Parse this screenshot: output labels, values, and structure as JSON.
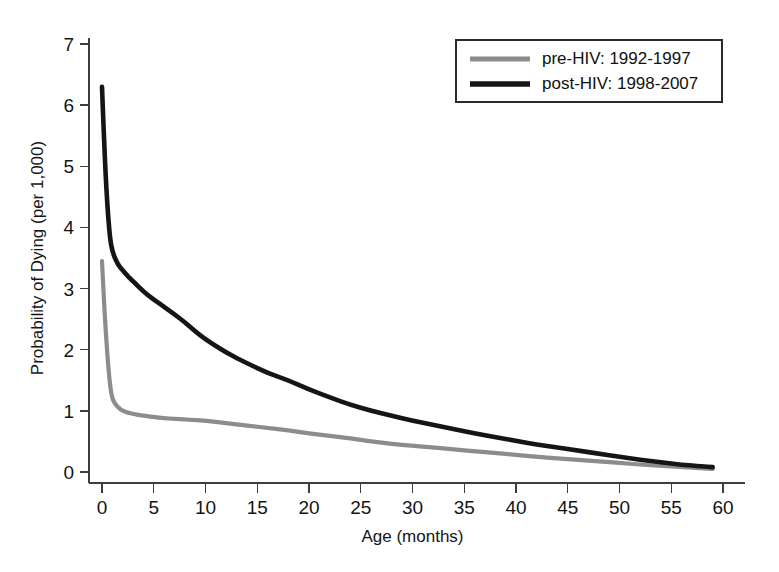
{
  "chart_data": {
    "type": "line",
    "title": "",
    "xlabel": "Age (months)",
    "ylabel": "Probability of Dying (per 1,000)",
    "xlim": [
      0,
      60
    ],
    "ylim": [
      0,
      7
    ],
    "xticks": [
      0,
      5,
      10,
      15,
      20,
      25,
      30,
      35,
      40,
      45,
      50,
      55,
      60
    ],
    "yticks": [
      0,
      1,
      2,
      3,
      4,
      5,
      6,
      7
    ],
    "xtick_labels": [
      "0",
      "5",
      "10",
      "15",
      "20",
      "25",
      "30",
      "35",
      "40",
      "45",
      "50",
      "55",
      "60"
    ],
    "ytick_labels": [
      "0",
      "1",
      "2",
      "3",
      "4",
      "5",
      "6",
      "7"
    ],
    "grid": false,
    "legend_position": "top-right",
    "x": [
      0,
      0.25,
      0.5,
      0.75,
      1,
      1.5,
      2,
      2.5,
      3,
      4,
      5,
      6,
      7,
      8,
      9,
      10,
      12,
      14,
      16,
      18,
      20,
      22,
      24,
      26,
      28,
      30,
      32,
      34,
      36,
      38,
      40,
      42,
      44,
      46,
      48,
      50,
      52,
      54,
      56,
      58,
      59
    ],
    "series": [
      {
        "name": "pre-HIV: 1992-1997",
        "color": "#8c8c8c",
        "linewidth": 4.2,
        "values": [
          3.45,
          2.6,
          1.95,
          1.45,
          1.18,
          1.06,
          1.0,
          0.97,
          0.95,
          0.92,
          0.9,
          0.88,
          0.87,
          0.86,
          0.85,
          0.84,
          0.8,
          0.76,
          0.72,
          0.68,
          0.63,
          0.59,
          0.55,
          0.5,
          0.46,
          0.43,
          0.4,
          0.37,
          0.34,
          0.31,
          0.28,
          0.25,
          0.22,
          0.2,
          0.17,
          0.15,
          0.12,
          0.1,
          0.08,
          0.06,
          0.05
        ]
      },
      {
        "name": "post-HIV: 1998-2007",
        "color": "#151515",
        "linewidth": 4.6,
        "values": [
          6.3,
          5.2,
          4.4,
          3.85,
          3.6,
          3.4,
          3.3,
          3.2,
          3.12,
          2.95,
          2.82,
          2.7,
          2.58,
          2.45,
          2.3,
          2.17,
          1.95,
          1.78,
          1.62,
          1.5,
          1.35,
          1.22,
          1.1,
          1.0,
          0.92,
          0.84,
          0.77,
          0.7,
          0.63,
          0.57,
          0.51,
          0.45,
          0.4,
          0.35,
          0.3,
          0.25,
          0.2,
          0.16,
          0.12,
          0.09,
          0.08
        ]
      }
    ]
  },
  "legend": {
    "entries": [
      {
        "label": "pre-HIV: 1992-1997",
        "color": "#8c8c8c"
      },
      {
        "label": "post-HIV: 1998-2007",
        "color": "#151515"
      }
    ]
  }
}
